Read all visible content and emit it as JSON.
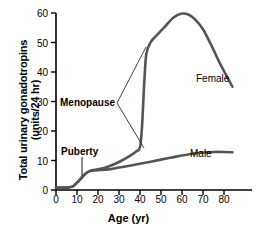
{
  "chart_data": {
    "type": "line",
    "title": "",
    "xlabel": "Age (yr)",
    "ylabel_line1": "Total urinary gonadotropins",
    "ylabel_line2": "(units/24 hr)",
    "xlim": [
      0,
      88
    ],
    "ylim": [
      0,
      60
    ],
    "grid": false,
    "legend_position": "inline-labels",
    "xticks": [
      0,
      10,
      20,
      30,
      40,
      50,
      60,
      70,
      80
    ],
    "yticks": [
      0,
      10,
      20,
      30,
      40,
      50,
      60
    ],
    "line_color": "#555555",
    "series": [
      {
        "name": "Female",
        "x": [
          0,
          3,
          6,
          8,
          10,
          12,
          14,
          16,
          18,
          20,
          25,
          30,
          35,
          38,
          40,
          41,
          42,
          43,
          45,
          48,
          52,
          56,
          60,
          63,
          66,
          70,
          74,
          78,
          81,
          84
        ],
        "values": [
          0.8,
          0.8,
          0.9,
          1.2,
          2.5,
          4.0,
          5.5,
          6.4,
          6.8,
          7.0,
          8.0,
          9.5,
          11.5,
          13.0,
          14.5,
          22.0,
          36.0,
          46.0,
          50.0,
          52.5,
          55.5,
          58.5,
          59.8,
          59.5,
          58.0,
          54.5,
          49.0,
          43.0,
          39.0,
          35.0
        ]
      },
      {
        "name": "Male",
        "x": [
          0,
          3,
          6,
          8,
          10,
          12,
          14,
          16,
          18,
          20,
          25,
          30,
          35,
          40,
          45,
          50,
          55,
          60,
          65,
          70,
          75,
          80,
          84
        ],
        "values": [
          0.8,
          0.8,
          0.9,
          1.2,
          2.5,
          4.0,
          5.5,
          6.4,
          6.6,
          6.7,
          7.0,
          7.6,
          8.2,
          8.9,
          9.6,
          10.3,
          11.0,
          11.7,
          12.3,
          12.7,
          12.9,
          12.9,
          12.8
        ]
      }
    ],
    "annotations": [
      {
        "text": "Menopause",
        "points_to_x": 42,
        "points_to_value_low": 14.5,
        "points_to_value_high": 48
      },
      {
        "text": "Puberty",
        "points_to_x": 12,
        "points_to_value": 4.5
      }
    ],
    "series_labels": [
      {
        "text": "Female",
        "near_x": 70,
        "near_value": 42
      },
      {
        "text": "Male",
        "near_x": 66,
        "near_value": 16
      }
    ]
  }
}
